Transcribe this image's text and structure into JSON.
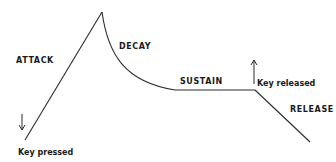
{
  "diagram": {
    "phases": [
      {
        "id": "attack",
        "label": "ATTACK"
      },
      {
        "id": "decay",
        "label": "DECAY"
      },
      {
        "id": "sustain",
        "label": "SUSTAIN"
      },
      {
        "id": "release",
        "label": "RELEASE"
      }
    ],
    "events": {
      "key_pressed": {
        "label": "Key pressed",
        "arrow": "down-arrow"
      },
      "key_released": {
        "label": "Key released",
        "arrow": "up-arrow"
      }
    },
    "colors": {
      "line": "#2a2a2a",
      "text": "#1a1a1a",
      "background": "#ffffff"
    }
  }
}
